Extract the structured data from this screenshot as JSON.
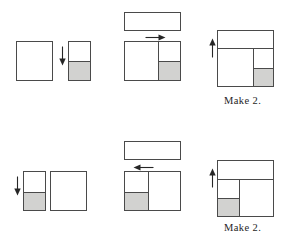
{
  "diagram": {
    "type": "quilt-block-piecing-diagram",
    "canvas": {
      "width": 287,
      "height": 239
    },
    "colors": {
      "outline": "#4a4a4a",
      "shaded_fabric": "#d2d2d0",
      "plain_fabric": "#ffffff",
      "background": "#ffffff",
      "arrow": "#262626",
      "caption_text": "#262626"
    },
    "rows": [
      {
        "id": "row-top",
        "label": "Top assembly sequence",
        "caption": "Make 2.",
        "steps": [
          {
            "id": "step-1",
            "label": "Join square to two-patch unit",
            "arrow": {
              "direction": "down",
              "meaning": "sew downward seam"
            },
            "units": [
              {
                "id": "large-square",
                "shading": "plain"
              },
              {
                "id": "two-patch-strip",
                "segments": [
                  {
                    "id": "strip-top",
                    "shading": "plain"
                  },
                  {
                    "id": "strip-bottom",
                    "shading": "shaded"
                  }
                ]
              }
            ]
          },
          {
            "id": "step-2",
            "label": "Add long rectangle to top of joined unit",
            "arrow": {
              "direction": "right",
              "meaning": "press seam to the right"
            },
            "units": [
              {
                "id": "long-rectangle",
                "shading": "plain"
              },
              {
                "id": "joined-unit",
                "segments": [
                  {
                    "id": "left-square",
                    "shading": "plain"
                  },
                  {
                    "id": "right-top",
                    "shading": "plain"
                  },
                  {
                    "id": "right-bottom",
                    "shading": "shaded"
                  }
                ]
              }
            ]
          },
          {
            "id": "step-3",
            "label": "Completed block",
            "arrow": {
              "direction": "up",
              "meaning": "press seam upward"
            },
            "units": [
              {
                "id": "finished-block",
                "segments": [
                  {
                    "id": "top-band",
                    "shading": "plain"
                  },
                  {
                    "id": "body-left",
                    "shading": "plain"
                  },
                  {
                    "id": "body-right-top",
                    "shading": "plain"
                  },
                  {
                    "id": "body-right-bottom",
                    "shading": "shaded"
                  }
                ]
              }
            ]
          }
        ]
      },
      {
        "id": "row-bottom",
        "label": "Bottom assembly sequence (mirror image)",
        "caption": "Make 2.",
        "steps": [
          {
            "id": "step-1",
            "label": "Join two-patch unit to square",
            "arrow": {
              "direction": "down",
              "meaning": "sew downward seam"
            },
            "units": [
              {
                "id": "two-patch-strip",
                "segments": [
                  {
                    "id": "strip-top",
                    "shading": "plain"
                  },
                  {
                    "id": "strip-bottom",
                    "shading": "shaded"
                  }
                ]
              },
              {
                "id": "large-square",
                "shading": "plain"
              }
            ]
          },
          {
            "id": "step-2",
            "label": "Add long rectangle to top of joined unit",
            "arrow": {
              "direction": "left",
              "meaning": "press seam to the left"
            },
            "units": [
              {
                "id": "long-rectangle",
                "shading": "plain"
              },
              {
                "id": "joined-unit",
                "segments": [
                  {
                    "id": "left-top",
                    "shading": "plain"
                  },
                  {
                    "id": "left-bottom",
                    "shading": "shaded"
                  },
                  {
                    "id": "right-square",
                    "shading": "plain"
                  }
                ]
              }
            ]
          },
          {
            "id": "step-3",
            "label": "Completed mirrored block",
            "arrow": {
              "direction": "up",
              "meaning": "press seam upward"
            },
            "units": [
              {
                "id": "finished-block",
                "segments": [
                  {
                    "id": "top-band",
                    "shading": "plain"
                  },
                  {
                    "id": "body-left-top",
                    "shading": "plain"
                  },
                  {
                    "id": "body-left-bottom",
                    "shading": "shaded"
                  },
                  {
                    "id": "body-right",
                    "shading": "plain"
                  }
                ]
              }
            ]
          }
        ]
      }
    ],
    "captions": {
      "top": "Make 2.",
      "bottom": "Make 2."
    }
  }
}
